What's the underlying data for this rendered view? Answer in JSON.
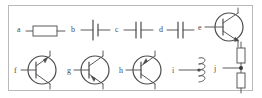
{
  "figure": {
    "type": "electronic-component-symbol-chart",
    "background_color": "#ffffff",
    "frame_color": "#b9b9b9",
    "ink_color": "#4a4a4a",
    "rows": 2,
    "items_per_row": [
      5,
      5
    ],
    "labels": [
      "a",
      "b",
      "c",
      "d",
      "e",
      "f",
      "g",
      "h",
      "i",
      "j"
    ]
  },
  "symbols": {
    "a": {
      "label": "a",
      "icon": "resistor-icon",
      "name": "resistor",
      "description": "rectangular resistor body with horizontal leads on both sides"
    },
    "b": {
      "label": "b",
      "icon": "battery-cell-icon",
      "name": "battery-cell",
      "description": "single cell: one long plate and one short plate with horizontal leads"
    },
    "c": {
      "label": "c",
      "icon": "capacitor-icon",
      "name": "capacitor",
      "description": "two equal parallel plates with horizontal leads"
    },
    "d": {
      "label": "d",
      "icon": "capacitor-icon",
      "name": "capacitor",
      "description": "two parallel plates with horizontal leads"
    },
    "e": {
      "label": "e",
      "icon": "npn-transistor-icon",
      "name": "npn-transistor",
      "description": "circle with vertical base bar, base lead at left, collector and emitter leads angled to upper and lower right"
    },
    "f": {
      "label": "f",
      "icon": "npn-transistor-icon",
      "name": "npn-transistor",
      "description": "circled transistor with arrow on the upper angled lead pointing away from the base"
    },
    "g": {
      "label": "g",
      "icon": "pnp-transistor-icon",
      "name": "pnp-transistor",
      "description": "circled transistor with arrow on the lower angled lead pointing toward the base"
    },
    "h": {
      "label": "h",
      "icon": "pnp-transistor-icon",
      "name": "pnp-transistor",
      "description": "circled transistor with arrow on the upper angled lead pointing toward the base"
    },
    "i": {
      "label": "i",
      "icon": "inductor-coil-icon",
      "name": "inductor",
      "description": "coil of three loops with a horizontal lead and a connection dot"
    },
    "j": {
      "label": "j",
      "icon": "voltage-divider-icon",
      "name": "voltage-divider",
      "description": "two vertically stacked resistors in series with a horizontal tap lead at the junction dot"
    }
  }
}
